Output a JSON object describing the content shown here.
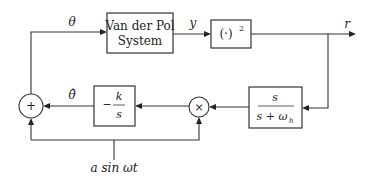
{
  "diagram": {
    "blocks": {
      "plant": {
        "line1": "Van der Pol",
        "line2": "System"
      },
      "square": {
        "label": "(·)",
        "exp": "2"
      },
      "highpass": {
        "num": "s",
        "den_s": "s + ω",
        "den_sub": "h"
      },
      "integrator": {
        "sign": "−",
        "num": "k",
        "den": "s"
      },
      "multiplier": {
        "symbol": "×"
      },
      "summer": {
        "symbol": "+"
      }
    },
    "signals": {
      "theta": "θ",
      "theta_hat": "θ̂",
      "y": "y",
      "r": "r",
      "dither": "a sin ωt"
    }
  }
}
